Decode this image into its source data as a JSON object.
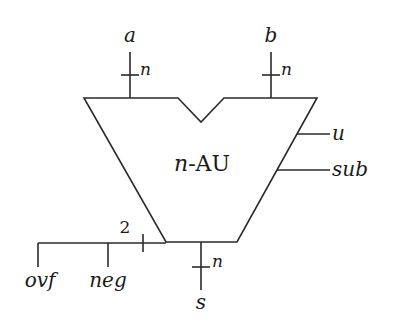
{
  "diagram": {
    "title": "n-AU",
    "block_label": "n-AU",
    "inputs": [
      {
        "name": "a",
        "width_label": "n"
      },
      {
        "name": "b",
        "width_label": "n"
      }
    ],
    "controls": [
      {
        "name": "u"
      },
      {
        "name": "sub"
      }
    ],
    "outputs": [
      {
        "name": "s",
        "width_label": "n"
      },
      {
        "name": "ovf"
      },
      {
        "name": "neg"
      }
    ],
    "flag_bus_width": "2",
    "colors": {
      "line": "#2a2a2a",
      "background": "#ffffff"
    }
  }
}
